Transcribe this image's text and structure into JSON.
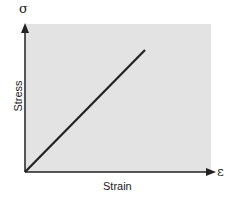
{
  "diagram": {
    "y_symbol": "σ",
    "x_symbol": "ε",
    "x_label": "Strain",
    "y_label": "Stress",
    "colors": {
      "background": "#e3e3e3",
      "axis": "#222222",
      "line": "#222222"
    },
    "line": {
      "type": "linear",
      "from": [
        0,
        0
      ],
      "to": [
        0.65,
        0.82
      ]
    }
  }
}
